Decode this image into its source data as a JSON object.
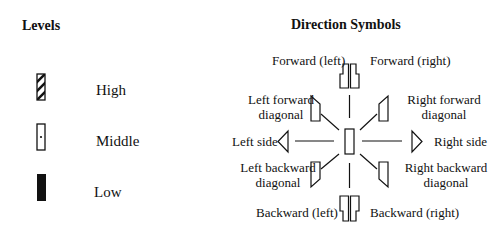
{
  "levels": {
    "title": "Levels",
    "items": [
      {
        "label": "High",
        "symbol": "hatched-rectangle"
      },
      {
        "label": "Middle",
        "symbol": "dotted-rectangle"
      },
      {
        "label": "Low",
        "symbol": "filled-rectangle"
      }
    ]
  },
  "directions": {
    "title": "Direction Symbols",
    "forward_left": "Forward (left)",
    "forward_right": "Forward (right)",
    "left_forward_diagonal_1": "Left forward",
    "left_forward_diagonal_2": "diagonal",
    "right_forward_diagonal_1": "Right forward",
    "right_forward_diagonal_2": "diagonal",
    "left_side": "Left side",
    "right_side": "Right side",
    "left_backward_diagonal_1": "Left backward",
    "left_backward_diagonal_2": "diagonal",
    "right_backward_diagonal_1": "Right backward",
    "right_backward_diagonal_2": "diagonal",
    "backward_left": "Backward (left)",
    "backward_right": "Backward (right)"
  }
}
